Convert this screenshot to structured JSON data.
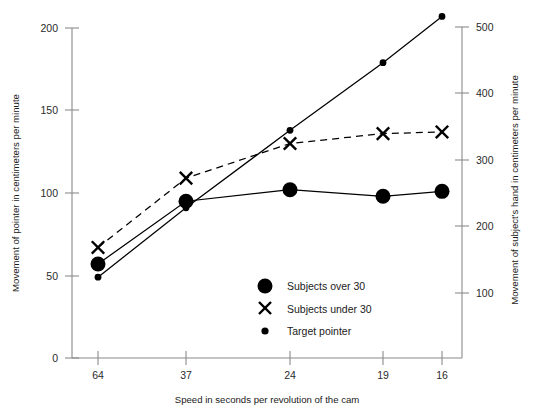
{
  "chart_data": {
    "type": "line",
    "title": "",
    "subtitle": "",
    "xlabel": "Speed in seconds per revolution of the cam",
    "ylabel": "Movement of pointer in centimeters per minute",
    "y2label": "Movement of subject's hand in centimeters per minute",
    "categories": [
      "64",
      "37",
      "24",
      "19",
      "16"
    ],
    "x_tick_labels": [
      "64",
      "37",
      "24",
      "19",
      "16"
    ],
    "y_tick_labels": [
      "0",
      "50",
      "100",
      "150",
      "200"
    ],
    "y_tick_values": [
      0,
      50,
      100,
      150,
      200
    ],
    "ylim": [
      0,
      200
    ],
    "y2_tick_labels": [
      "100",
      "200",
      "300",
      "400",
      "500"
    ],
    "y2_tick_values": [
      100,
      200,
      300,
      400,
      500
    ],
    "y2lim": [
      0,
      540
    ],
    "grid": false,
    "legend_position": "inside-bottom-center",
    "series": [
      {
        "name": "Subjects over 30",
        "marker": "large-filled-circle",
        "linestyle": "solid",
        "values": [
          57,
          95,
          102,
          98,
          101
        ]
      },
      {
        "name": "Subjects under 30",
        "marker": "x",
        "linestyle": "dashed",
        "values": [
          67,
          109,
          130,
          136,
          137
        ]
      },
      {
        "name": "Target pointer",
        "marker": "small-filled-circle",
        "linestyle": "solid",
        "values": [
          49,
          91,
          138,
          179,
          207
        ]
      }
    ],
    "legend_entries": [
      {
        "label": "Subjects over 30",
        "marker": "large-filled-circle"
      },
      {
        "label": "Subjects under 30",
        "marker": "x"
      },
      {
        "label": "Target pointer",
        "marker": "small-filled-circle"
      }
    ],
    "colors": {
      "series": "#000000",
      "axis": "#8a8a8a",
      "text": "#1a1a1a",
      "background": "#ffffff"
    }
  }
}
